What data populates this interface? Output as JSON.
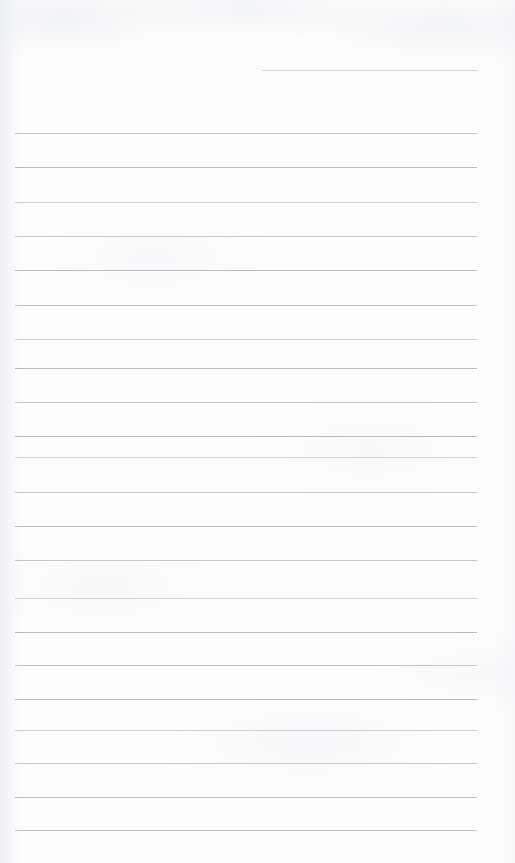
{
  "document": {
    "kind": "lined-paper-scan",
    "description": "Blank ruled notebook page",
    "page_width": 515,
    "page_height": 863,
    "paper_color": "#fdfdfd",
    "rule_color": "#b8bcc2",
    "has_text_content": false,
    "has_margin_rule": false,
    "has_header": false
  },
  "ruling": {
    "line_count": 22,
    "full_line_count": 21,
    "partial_line_count": 1,
    "line_spacing_px": 34.3,
    "full_line_start_x": 15,
    "full_line_end_x": 477,
    "first_full_line_y": 133,
    "last_line_y": 830,
    "line_thickness_px": 1,
    "lines": [
      {
        "index": 0,
        "y": 70,
        "x_start": 262,
        "x_end": 478,
        "type": "partial",
        "tone": "partial"
      },
      {
        "index": 1,
        "y": 133,
        "x_start": 15,
        "x_end": 477,
        "type": "full",
        "tone": "tone-a"
      },
      {
        "index": 2,
        "y": 167,
        "x_start": 15,
        "x_end": 477,
        "type": "full",
        "tone": "tone-b"
      },
      {
        "index": 3,
        "y": 202,
        "x_start": 15,
        "x_end": 477,
        "type": "full",
        "tone": "tone-c"
      },
      {
        "index": 4,
        "y": 236,
        "x_start": 15,
        "x_end": 477,
        "type": "full",
        "tone": "tone-a"
      },
      {
        "index": 5,
        "y": 270,
        "x_start": 15,
        "x_end": 477,
        "type": "full",
        "tone": "tone-b"
      },
      {
        "index": 6,
        "y": 305,
        "x_start": 15,
        "x_end": 477,
        "type": "full",
        "tone": "tone-a"
      },
      {
        "index": 7,
        "y": 339,
        "x_start": 15,
        "x_end": 477,
        "type": "full",
        "tone": "tone-c"
      },
      {
        "index": 8,
        "y": 368,
        "x_start": 15,
        "x_end": 477,
        "type": "full",
        "tone": "tone-b"
      },
      {
        "index": 9,
        "y": 402,
        "x_start": 15,
        "x_end": 477,
        "type": "full",
        "tone": "tone-a"
      },
      {
        "index": 10,
        "y": 436,
        "x_start": 15,
        "x_end": 477,
        "type": "full",
        "tone": "tone-b"
      },
      {
        "index": 11,
        "y": 457,
        "x_start": 15,
        "x_end": 477,
        "type": "full",
        "tone": "tone-c"
      },
      {
        "index": 12,
        "y": 492,
        "x_start": 15,
        "x_end": 477,
        "type": "full",
        "tone": "tone-a"
      },
      {
        "index": 13,
        "y": 526,
        "x_start": 15,
        "x_end": 477,
        "type": "full",
        "tone": "tone-b"
      },
      {
        "index": 14,
        "y": 560,
        "x_start": 15,
        "x_end": 477,
        "type": "full",
        "tone": "tone-a"
      },
      {
        "index": 15,
        "y": 598,
        "x_start": 15,
        "x_end": 477,
        "type": "full",
        "tone": "tone-c"
      },
      {
        "index": 16,
        "y": 632,
        "x_start": 15,
        "x_end": 477,
        "type": "full",
        "tone": "tone-b"
      },
      {
        "index": 17,
        "y": 665,
        "x_start": 15,
        "x_end": 477,
        "type": "full",
        "tone": "tone-a"
      },
      {
        "index": 18,
        "y": 699,
        "x_start": 15,
        "x_end": 477,
        "type": "full",
        "tone": "tone-b"
      },
      {
        "index": 19,
        "y": 730,
        "x_start": 15,
        "x_end": 477,
        "type": "full",
        "tone": "tone-c"
      },
      {
        "index": 20,
        "y": 763,
        "x_start": 15,
        "x_end": 477,
        "type": "full",
        "tone": "tone-a"
      },
      {
        "index": 21,
        "y": 797,
        "x_start": 15,
        "x_end": 477,
        "type": "full",
        "tone": "tone-b"
      },
      {
        "index": 22,
        "y": 830,
        "x_start": 15,
        "x_end": 477,
        "type": "full",
        "tone": "tone-a"
      }
    ]
  }
}
